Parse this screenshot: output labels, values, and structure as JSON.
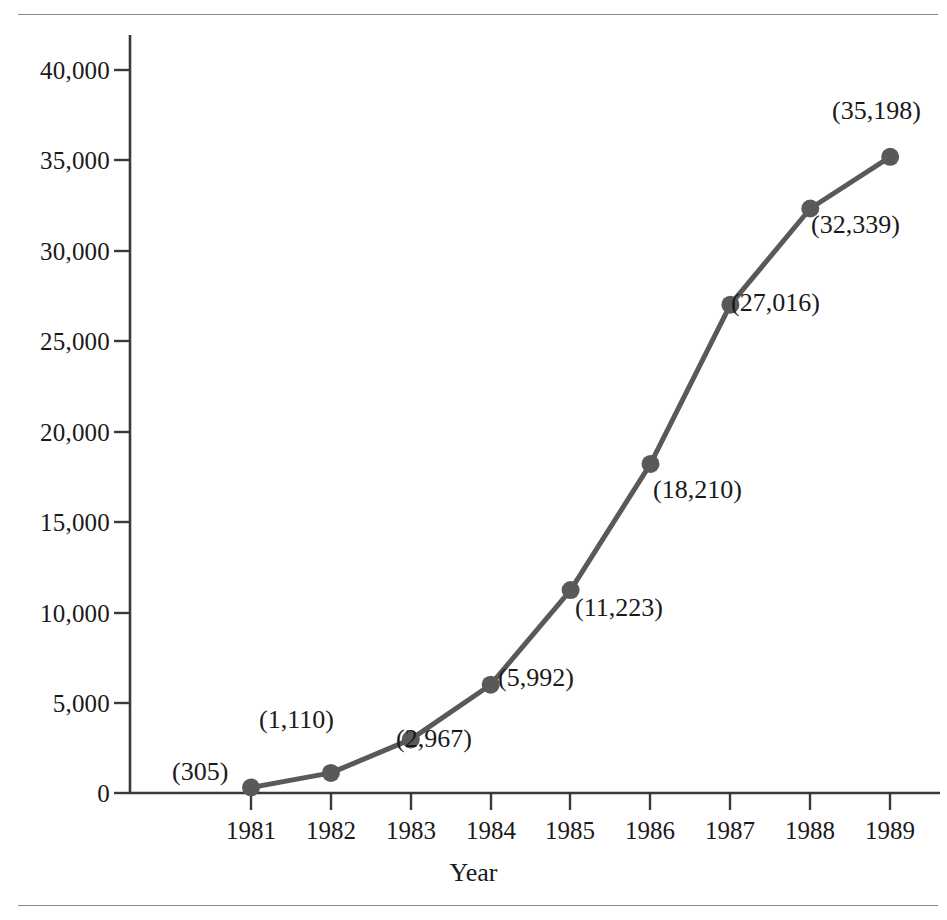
{
  "figure": {
    "background_color": "#ffffff",
    "rule_color": "#8a8a8a",
    "series_color": "#595959"
  },
  "chart_data": {
    "type": "line",
    "title": "",
    "subtitle": "",
    "xlabel": "Year",
    "ylabel": "",
    "categories": [
      "1981",
      "1982",
      "1983",
      "1984",
      "1985",
      "1986",
      "1987",
      "1988",
      "1989"
    ],
    "x": [
      1981,
      1982,
      1983,
      1984,
      1985,
      1986,
      1987,
      1988,
      1989
    ],
    "values": [
      305,
      1110,
      2967,
      5992,
      11223,
      18210,
      27016,
      32339,
      35198
    ],
    "point_labels": [
      "(305)",
      "(1,110)",
      "(2,967)",
      "(5,992)",
      "(11,223)",
      "(18,210)",
      "(27,016)",
      "(32,339)",
      "(35,198)"
    ],
    "label_positions": [
      "left",
      "above",
      "below-right",
      "below-right",
      "below-right",
      "below-right",
      "below-right",
      "below-right",
      "above"
    ],
    "ylim": [
      0,
      40000
    ],
    "yticks": [
      0,
      5000,
      10000,
      15000,
      20000,
      25000,
      30000,
      35000,
      40000
    ],
    "ytick_labels": [
      "0",
      "5,000",
      "10,000",
      "15,000",
      "20,000",
      "25,000",
      "30,000",
      "35,000",
      "40,000"
    ],
    "grid": false,
    "legend": null,
    "marker": "filled-circle",
    "series_color": "#595959"
  }
}
